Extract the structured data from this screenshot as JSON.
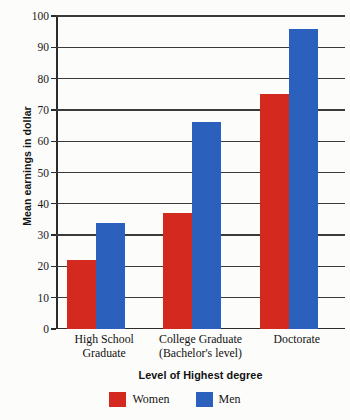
{
  "chart_data": {
    "type": "bar",
    "title": "",
    "xlabel": "Level of Highest degree",
    "ylabel": "Mean earnings in dollar",
    "categories": [
      "High School Graduate",
      "College Graduate (Bachelor's level)",
      "Doctorate"
    ],
    "category_lines": [
      [
        "High School",
        "Graduate"
      ],
      [
        "College Graduate",
        "(Bachelor's level)"
      ],
      [
        "Doctorate"
      ]
    ],
    "series": [
      {
        "name": "Women",
        "color": "#d3291f",
        "values": [
          22,
          37,
          75
        ]
      },
      {
        "name": "Men",
        "color": "#2c60bd",
        "values": [
          34,
          66,
          96
        ]
      }
    ],
    "ylim": [
      0,
      100
    ],
    "ytick_step": 10,
    "yticks": [
      0,
      10,
      20,
      30,
      40,
      50,
      60,
      70,
      80,
      90,
      100
    ],
    "ytick_labels": [
      "0",
      "10",
      "20",
      "30",
      "40",
      "50",
      "60",
      "70",
      "80",
      "90",
      "100"
    ],
    "grid": "horizontal",
    "legend_position": "bottom-center"
  },
  "legend": {
    "items": [
      {
        "label": "Women",
        "color": "#d3291f"
      },
      {
        "label": "Men",
        "color": "#2c60bd"
      }
    ]
  },
  "axes": {
    "y_title": "Mean earnings in dollar",
    "x_title": "Level of Highest degree"
  }
}
